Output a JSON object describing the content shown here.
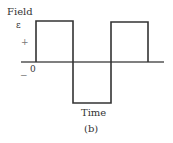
{
  "figure": {
    "y_axis_label": "Field",
    "amplitude_symbol": "ε",
    "plus_sign": "+",
    "minus_sign": "−",
    "origin_label": "0",
    "x_axis_label": "Time",
    "caption": "(b)"
  },
  "waveform": {
    "type": "square-wave",
    "color": "#333333",
    "segments": [
      {
        "start": 0,
        "end": 1,
        "level": "+ε"
      },
      {
        "start": 1,
        "end": 2,
        "level": "-ε"
      },
      {
        "start": 2,
        "end": 3,
        "level": "+ε"
      }
    ]
  }
}
